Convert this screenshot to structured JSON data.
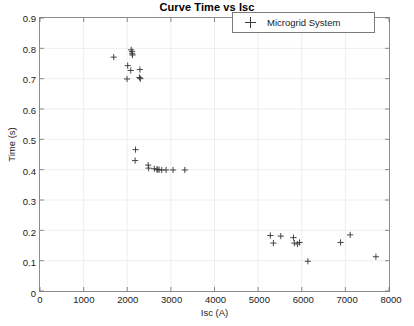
{
  "chart_data": {
    "type": "scatter",
    "title": "Curve Time vs Isc",
    "xlabel": "Isc (A)",
    "ylabel": "Time (s)",
    "xlim": [
      0,
      8000
    ],
    "ylim": [
      0,
      0.9
    ],
    "xticks": [
      0,
      1000,
      2000,
      3000,
      4000,
      5000,
      6000,
      7000,
      8000
    ],
    "xtick_labels": [
      "0",
      "1000",
      "2000",
      "3000",
      "4000",
      "5000",
      "6000",
      "7000",
      "8000"
    ],
    "yticks": [
      0,
      0.1,
      0.2,
      0.3,
      0.4,
      0.5,
      0.6,
      0.7,
      0.8,
      0.9
    ],
    "ytick_labels": [
      "0",
      "0.1",
      "0.2",
      "0.3",
      "0.4",
      "0.5",
      "0.6",
      "0.7",
      "0.8",
      "0.9"
    ],
    "grid": true,
    "legend_position": "top-right",
    "marker": "plus",
    "marker_color": "#3a3a3a",
    "series": [
      {
        "name": "Microgrid System",
        "points": [
          [
            1690,
            0.771
          ],
          [
            2090,
            0.795
          ],
          [
            2110,
            0.789
          ],
          [
            2115,
            0.782
          ],
          [
            2120,
            0.778
          ],
          [
            2010,
            0.743
          ],
          [
            2080,
            0.727
          ],
          [
            2290,
            0.73
          ],
          [
            1995,
            0.699
          ],
          [
            2280,
            0.704
          ],
          [
            2300,
            0.7
          ],
          [
            2190,
            0.466
          ],
          [
            2180,
            0.43
          ],
          [
            2480,
            0.415
          ],
          [
            2490,
            0.405
          ],
          [
            2620,
            0.403
          ],
          [
            2680,
            0.401
          ],
          [
            2700,
            0.4
          ],
          [
            2730,
            0.4
          ],
          [
            2790,
            0.399
          ],
          [
            2890,
            0.399
          ],
          [
            3050,
            0.399
          ],
          [
            3320,
            0.399
          ],
          [
            5280,
            0.183
          ],
          [
            5350,
            0.158
          ],
          [
            5520,
            0.181
          ],
          [
            5810,
            0.176
          ],
          [
            5830,
            0.158
          ],
          [
            5900,
            0.155
          ],
          [
            5950,
            0.16
          ],
          [
            6140,
            0.098
          ],
          [
            6890,
            0.16
          ],
          [
            7110,
            0.185
          ],
          [
            7700,
            0.113
          ]
        ]
      }
    ]
  },
  "legend": {
    "entries": [
      {
        "label": "Microgrid System",
        "marker": "plus-marker"
      }
    ]
  }
}
